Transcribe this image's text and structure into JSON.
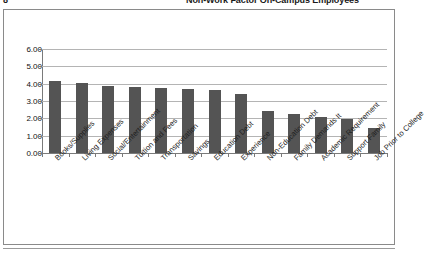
{
  "header": {
    "page_number": "8",
    "title_clipped": "Non-Work Factor On-Campus Employees"
  },
  "chart_data": {
    "type": "bar",
    "title": "Non-Work Factor On-Campus Employees",
    "xlabel": "",
    "ylabel": "",
    "ylim": [
      0,
      6
    ],
    "ytick_labels": [
      "6.00",
      "5.00",
      "4.00",
      "3.00",
      "2.00",
      "1.00",
      "0.00"
    ],
    "ytick_values": [
      6,
      5,
      4,
      3,
      2,
      1,
      0
    ],
    "grid": true,
    "legend": "none",
    "bar_color": "#545454",
    "categories": [
      "Books/Supplies",
      "Living Expenses",
      "Social/Entertainment",
      "Tuition and Fees",
      "Transportation",
      "Savings",
      "Education Debt",
      "Experience",
      "Non-Education Debt",
      "Family Demands It",
      "Academic Requirement",
      "Support Family",
      "Job Prior to College"
    ],
    "values": [
      4.15,
      4.05,
      3.85,
      3.8,
      3.75,
      3.7,
      3.65,
      3.4,
      2.4,
      2.25,
      2.1,
      1.95,
      1.45
    ]
  }
}
